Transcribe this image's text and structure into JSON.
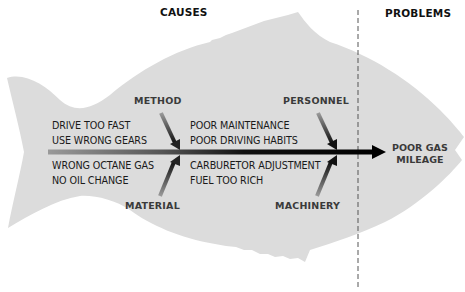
{
  "headers": {
    "causes": "CAUSES",
    "problems": "PROBLEMS"
  },
  "bones": {
    "method": "METHOD",
    "material": "MATERIAL",
    "personnel": "PERSONNEL",
    "machinery": "MACHINERY"
  },
  "causes": {
    "method": [
      "DRIVE TOO FAST",
      "USE WRONG GEARS"
    ],
    "material": [
      "WRONG OCTANE GAS",
      "NO OIL CHANGE"
    ],
    "personnel": [
      "POOR MAINTENANCE",
      "POOR DRIVING HABITS"
    ],
    "machinery": [
      "CARBURETOR ADJUSTMENT",
      "FUEL TOO RICH"
    ]
  },
  "problem": [
    "POOR GAS",
    "MILEAGE"
  ],
  "colors": {
    "fish_body": "#dcdcdc",
    "spine": "#111111",
    "header_text": "#111111",
    "label_text": "#3a3a3a",
    "divider": "#555555"
  }
}
